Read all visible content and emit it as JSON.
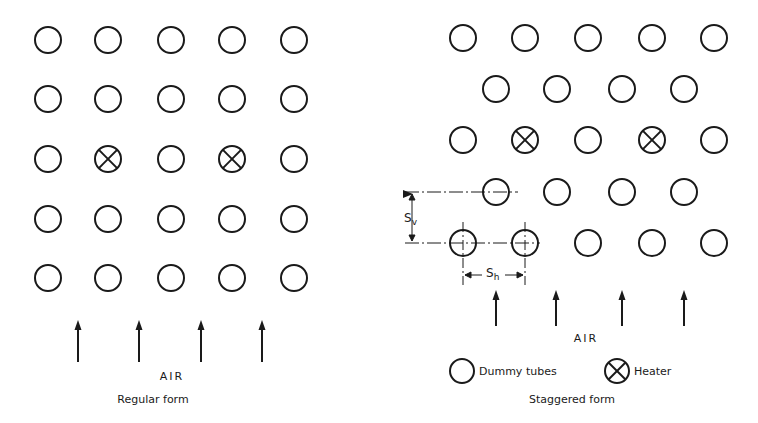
{
  "regular": {
    "title": "Regular form",
    "air_label": "AIR",
    "radius": 13,
    "columns_x": [
      48,
      108,
      171,
      232,
      294
    ],
    "rows_y": [
      40,
      99,
      159,
      219,
      278
    ],
    "heaters": [
      [
        2,
        1
      ],
      [
        2,
        3
      ]
    ],
    "arrows_x": [
      78,
      139,
      201,
      262
    ],
    "arrow_y": [
      320,
      362
    ]
  },
  "staggered": {
    "title": "Staggered form",
    "air_label": "AIR",
    "radius": 13,
    "odd_row_x": [
      463,
      525,
      588,
      652,
      714
    ],
    "even_row_x": [
      496,
      557,
      622,
      684
    ],
    "rows_y": [
      38,
      89,
      140,
      192,
      243
    ],
    "heaters": [
      [
        2,
        1
      ],
      [
        2,
        3
      ]
    ],
    "arrows_x": [
      496,
      556,
      622,
      684
    ],
    "arrow_y": [
      290,
      326
    ],
    "dim_sv": "S",
    "dim_sv_sub": "v",
    "dim_sh": "S",
    "dim_sh_sub": "h"
  },
  "legend": {
    "dummy_label": "Dummy tubes",
    "heater_label": "Heater"
  },
  "colors": {
    "ink": "#1a1a1a",
    "background": "#ffffff"
  }
}
